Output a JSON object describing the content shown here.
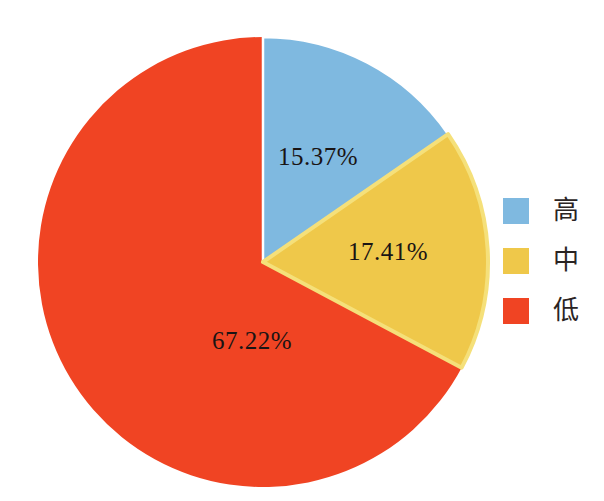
{
  "chart_data": {
    "type": "pie",
    "title": "",
    "categories": [
      "高",
      "中",
      "低"
    ],
    "values": [
      15.37,
      17.41,
      67.22
    ],
    "labels": [
      "15.37%",
      "17.41%",
      "67.22%"
    ],
    "colors": [
      "#7FB9E0",
      "#EFC84A",
      "#F04423"
    ],
    "units": "percent",
    "start_angle_deg": 0,
    "direction": "clockwise",
    "legend_position": "right",
    "grid": false,
    "slice_outline_color": "#F5E07A",
    "background": "#FFFFFF"
  },
  "legend": {
    "items": [
      {
        "label": "高",
        "color": "#7FB9E0",
        "value": "15.37%"
      },
      {
        "label": "中",
        "color": "#EFC84A",
        "value": "17.41%"
      },
      {
        "label": "低",
        "color": "#F04423",
        "value": "67.22%"
      }
    ]
  },
  "slice_labels": {
    "high": "15.37%",
    "mid": "17.41%",
    "low": "67.22%"
  }
}
